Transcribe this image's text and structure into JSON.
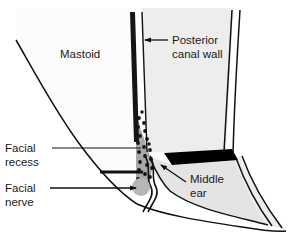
{
  "figure": {
    "background_color": "#ffffff",
    "width": 299,
    "height": 237
  },
  "colors": {
    "outline": "#111111",
    "canal_fill": "#ededed",
    "mastoid_fill": "#fbfbfb",
    "middle_ear_fill": "#e3e3e3",
    "recess_fill": "#a8a8a8",
    "stipple_dot": "#141414",
    "nerve_fill": "#b4b4b4",
    "annulus_black": "#000000",
    "text": "#1a1a1a"
  },
  "labels": {
    "mastoid": {
      "text": "Mastoid",
      "x": 60,
      "y": 58
    },
    "posterior_canal_wall": {
      "line1": "Posterior",
      "line2": "canal wall",
      "x": 172,
      "y": 43,
      "line2_y": 57
    },
    "facial_recess": {
      "line1": "Facial",
      "line2": "recess",
      "x": 5,
      "y": 152,
      "line2_y": 166
    },
    "facial_nerve": {
      "line1": "Facial",
      "line2": "nerve",
      "x": 5,
      "y": 192,
      "line2_y": 206
    },
    "middle_ear": {
      "line1": "Middle",
      "line2": "ear",
      "x": 190,
      "y": 183,
      "line2_y": 197
    }
  },
  "structures": {
    "mastoid_outline": "M 16,40 C 30,62 52,104 78,140 C 100,170 120,192 136,203",
    "mastoid_region": "M 16,40 C 30,62 52,104 78,140 C 100,170 120,192 136,203 L 136,8 L 16,8 Z",
    "canal_outer_left": "M 133,12 L 138,150",
    "canal_inner_left": "M 142,12 L 146,152",
    "canal_wall_bar": "M 131,12 L 135,143 L 140,143 L 136,12 Z",
    "canal_right_outer": "M 232,10 L 225,152",
    "canal_right_inner": "M 238,10 L 231,150",
    "canal_lumen": "M 142,12 L 146,152 L 225,152 L 232,10 Z",
    "middle_ear_region": "M 146,160 C 152,172 158,182 166,190 C 190,208 230,214 262,222 C 248,200 238,176 232,158 Z",
    "tympanic_annulus": "M 164,155 L 232,151 L 238,160 L 170,166 Z",
    "recess_wedge": "M 137,116 L 150,150 L 152,170 L 146,188 L 137,188 Z",
    "nerve_circle": {
      "cx": 141,
      "cy": 187,
      "r": 9
    },
    "eardrum_squiggle": "M 146,155 C 152,166 148,176 152,186 C 154,194 150,200 146,208",
    "lower_border": "M 136,203 C 160,214 200,220 240,226 C 258,229 272,231 284,230"
  },
  "leaders": {
    "posterior_canal_wall_arrow": {
      "from_x": 168,
      "from_y": 40,
      "to_x": 146,
      "to_y": 40,
      "style": "arrow"
    },
    "facial_recess_line": {
      "from_x": 52,
      "from_y": 148,
      "to_x": 140,
      "to_y": 148,
      "style": "plain"
    },
    "facial_recess_thick_line": {
      "from_x": 100,
      "from_y": 172,
      "to_x": 142,
      "to_y": 172,
      "style": "thick"
    },
    "facial_nerve_arrow": {
      "from_x": 50,
      "from_y": 188,
      "to_x": 136,
      "to_y": 188,
      "style": "arrow"
    },
    "middle_ear_arrow": {
      "from_x": 186,
      "from_y": 182,
      "to_x": 160,
      "to_y": 164,
      "style": "arrow"
    }
  },
  "stipple_dots": [
    [
      139,
      120
    ],
    [
      145,
      124
    ],
    [
      140,
      130
    ],
    [
      147,
      133
    ],
    [
      141,
      139
    ],
    [
      148,
      142
    ],
    [
      143,
      147
    ],
    [
      150,
      150
    ],
    [
      139,
      152
    ],
    [
      145,
      156
    ],
    [
      151,
      158
    ],
    [
      141,
      161
    ],
    [
      147,
      164
    ],
    [
      152,
      167
    ],
    [
      140,
      169
    ],
    [
      145,
      173
    ],
    [
      150,
      175
    ],
    [
      139,
      177
    ],
    [
      144,
      181
    ],
    [
      149,
      183
    ],
    [
      141,
      186
    ],
    [
      146,
      189
    ],
    [
      143,
      115
    ],
    [
      137,
      126
    ],
    [
      137,
      136
    ],
    [
      137,
      145
    ],
    [
      137,
      158
    ],
    [
      137,
      166
    ],
    [
      137,
      174
    ],
    [
      137,
      183
    ],
    [
      149,
      129
    ],
    [
      151,
      140
    ],
    [
      153,
      162
    ],
    [
      148,
      119
    ]
  ]
}
